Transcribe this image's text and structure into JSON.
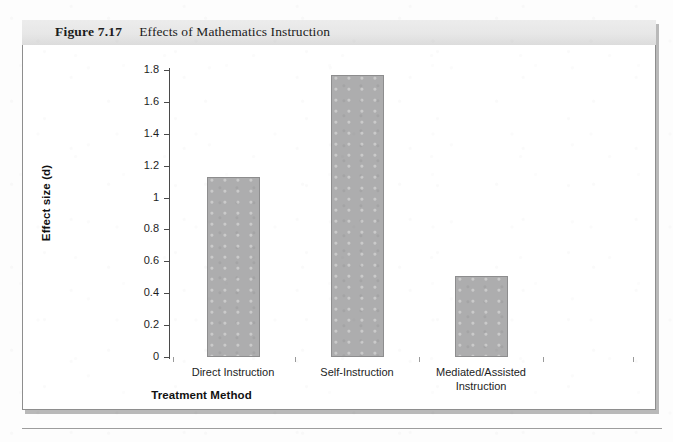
{
  "figure": {
    "number": "Figure 7.17",
    "caption": "Effects of Mathematics Instruction"
  },
  "chart_data": {
    "type": "bar",
    "title": "Effects of Mathematics Instruction",
    "categories": [
      "Direct Instruction",
      "Self-Instruction",
      "Mediated/Assisted Instruction"
    ],
    "category_lines": [
      [
        "Direct Instruction"
      ],
      [
        "Self-Instruction"
      ],
      [
        "Mediated/Assisted",
        "Instruction"
      ]
    ],
    "values": [
      1.13,
      1.77,
      0.51
    ],
    "xlabel": "Treatment Method",
    "ylabel": "Effect size (d)",
    "ylim": [
      0,
      1.8
    ],
    "ytick_step": 0.2,
    "yticks": [
      "0",
      "0.2",
      "0.4",
      "0.6",
      "0.8",
      "1",
      "1.2",
      "1.4",
      "1.6",
      "1.8"
    ],
    "ytick_values": [
      0,
      0.2,
      0.4,
      0.6,
      0.8,
      1,
      1.2,
      1.4,
      1.6,
      1.8
    ],
    "grid": false,
    "legend": null,
    "bar_color": "#adadae",
    "bar_border_color": "#8d8d8e"
  }
}
